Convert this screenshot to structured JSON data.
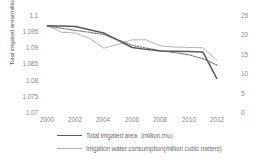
{
  "chart_data": {
    "type": "line",
    "title": "",
    "xlabel": "",
    "ylabel": "Total irrigated area(million mu)",
    "y2label": "",
    "x": [
      2000,
      2001,
      2002,
      2003,
      2004,
      2005,
      2006,
      2007,
      2008,
      2009,
      2010,
      2011,
      2012
    ],
    "xticks": [
      "2000",
      "2002",
      "2004",
      "2006",
      "2008",
      "2010",
      "2012"
    ],
    "xlim": [
      2000,
      2012
    ],
    "ylim": [
      1.07,
      1.1
    ],
    "yticks": [
      "1.1",
      "1.095",
      "1.09",
      "1.085",
      "1.08",
      "1.075",
      "1.07"
    ],
    "y2lim": [
      0,
      25
    ],
    "y2ticks": [
      "25",
      "20",
      "15",
      "10",
      "5",
      "0"
    ],
    "grid": false,
    "legend_position": "bottom",
    "series": [
      {
        "name": "Total irrigated area（million.mu）",
        "axis": "left",
        "style": "solid",
        "color": "#595959",
        "values": [
          1.0968,
          1.0967,
          1.0965,
          1.0955,
          1.0945,
          1.0922,
          1.0899,
          1.0893,
          1.0888,
          1.0887,
          1.0886,
          1.0885,
          1.08
        ]
      },
      {
        "name": "Irrigation water consumption(million cubic meters)",
        "axis": "right",
        "style": "solid-light",
        "color": "#b4b4b4",
        "values": [
          22.5,
          20.6,
          20.4,
          19.0,
          16.4,
          17.4,
          18.6,
          18.6,
          17.0,
          16.7,
          16.6,
          16.5,
          13.2
        ]
      },
      {
        "name": "trend",
        "axis": "left",
        "style": "dotted",
        "color": "#757575",
        "values": [
          1.0966,
          1.096,
          1.0953,
          1.0947,
          1.094,
          1.0923,
          1.0906,
          1.0897,
          1.0889,
          1.0883,
          1.0876,
          1.0864,
          1.0843
        ]
      }
    ]
  },
  "legend": {
    "items": [
      {
        "label": "Total irrigated area（million.mu）",
        "swatch": "solid"
      },
      {
        "label": "Irrigation  water consumption(million cubic meters)",
        "swatch": "light"
      }
    ]
  },
  "colors": {
    "series_main": "#595959",
    "series_secondary": "#b4b4b4",
    "series_trend": "#757575",
    "text": "#8a8a8a",
    "background": "#ffffff"
  }
}
